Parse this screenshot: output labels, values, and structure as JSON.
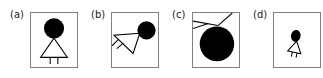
{
  "figure": {
    "background_color": "#ffffff",
    "frame_color": "#808080",
    "ink_color": "#000000",
    "panel_count": 4,
    "width": 323,
    "height": 78
  },
  "panels": [
    {
      "id": "a",
      "label": "(a)",
      "caption_text": "(a)",
      "description": "upright figure: filled circle head above open triangle body with two short vertical legs",
      "transform": "identity",
      "rotation_deg": 0,
      "scale": 1.0,
      "head": {
        "shape": "circle",
        "cx": 24,
        "cy": 16,
        "r": 10.5,
        "fill": "#000000"
      },
      "body": {
        "shape": "triangle",
        "points": "24,26 10,46 38,46",
        "stroke": "#000000",
        "fill": "none"
      },
      "legs": [
        {
          "x1": 20,
          "y1": 46,
          "x2": 20,
          "y2": 53
        },
        {
          "x1": 28,
          "y1": 46,
          "x2": 28,
          "y2": 53
        }
      ]
    },
    {
      "id": "b",
      "label": "(b)",
      "caption_text": "(b)",
      "description": "figure rotated roughly 110 degrees clockwise and shifted so the head sits at the upper right and the legs point to the lower left",
      "transform": "rotate",
      "rotation_deg": 110,
      "scale": 1.0,
      "head": {
        "shape": "circle",
        "cx": 36,
        "cy": 18,
        "r": 9.5,
        "fill": "#000000"
      },
      "body": {
        "shape": "triangle",
        "points": "29,21 2,23 22,42",
        "stroke": "#000000",
        "fill": "none"
      },
      "legs": [
        {
          "x1": 6,
          "y1": 27,
          "x2": 1,
          "y2": 33
        },
        {
          "x1": 11,
          "y1": 31,
          "x2": 5,
          "y2": 36
        }
      ]
    },
    {
      "id": "c",
      "label": "(c)",
      "caption_text": "(c)",
      "description": "figure scaled up strongly so only the large filled head and the upper edges of the triangle body remain inside the frame",
      "transform": "scale-up",
      "rotation_deg": 0,
      "scale": 3.2,
      "head": {
        "shape": "circle",
        "cx": 25,
        "cy": 31,
        "r": 18,
        "fill": "#000000"
      },
      "body": {
        "shape": "triangle",
        "points": "27,13 -6,8 -4,58",
        "stroke": "#000000",
        "fill": "none"
      },
      "legs": [],
      "extra_lines": [
        {
          "x1": 26,
          "y1": 13,
          "x2": 40,
          "y2": 1
        }
      ]
    },
    {
      "id": "d",
      "label": "(d)",
      "caption_text": "(d)",
      "description": "figure scaled down and tilted slightly, drawn small near the centre of the frame with an oval head",
      "transform": "scale-down",
      "rotation_deg": 12,
      "scale": 0.5,
      "head": {
        "shape": "ellipse",
        "cx": 21,
        "cy": 24,
        "rx": 5,
        "ry": 6.2,
        "fill": "#000000"
      },
      "body": {
        "shape": "triangle",
        "points": "23,30 17,41 30,40",
        "stroke": "#000000",
        "fill": "none"
      },
      "legs": [
        {
          "x1": 21,
          "y1": 40,
          "x2": 21,
          "y2": 45
        },
        {
          "x1": 26,
          "y1": 40,
          "x2": 26,
          "y2": 45
        }
      ]
    }
  ]
}
